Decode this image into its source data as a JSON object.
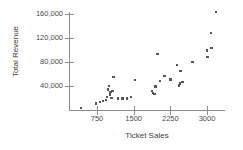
{
  "chart_data": {
    "type": "scatter",
    "title": "",
    "xlabel": "Ticket Sales",
    "ylabel": "Total Revenue",
    "xlim": [
      0,
      3300
    ],
    "ylim": [
      0,
      172000
    ],
    "grid": false,
    "legend": null,
    "xticks": [
      750,
      1500,
      2250,
      3000
    ],
    "xticklabels": [
      "750",
      "1500",
      "2250",
      "3000"
    ],
    "yticks": [
      40000,
      80000,
      120000,
      160000
    ],
    "yticklabels": [
      "40,000",
      "80,000",
      "120,000",
      "160,000"
    ],
    "marker": "square",
    "marker_color": "#555555",
    "points": [
      {
        "x": 420,
        "y": 3000
      },
      {
        "x": 730,
        "y": 11000
      },
      {
        "x": 810,
        "y": 13000
      },
      {
        "x": 870,
        "y": 15000
      },
      {
        "x": 930,
        "y": 17000
      },
      {
        "x": 960,
        "y": 22000
      },
      {
        "x": 980,
        "y": 34000
      },
      {
        "x": 1000,
        "y": 40000
      },
      {
        "x": 1010,
        "y": 26000
      },
      {
        "x": 1030,
        "y": 30000
      },
      {
        "x": 1050,
        "y": 20000
      },
      {
        "x": 1070,
        "y": 32000
      },
      {
        "x": 1090,
        "y": 55000
      },
      {
        "x": 1180,
        "y": 19000
      },
      {
        "x": 1270,
        "y": 19000
      },
      {
        "x": 1360,
        "y": 19000
      },
      {
        "x": 1450,
        "y": 22000
      },
      {
        "x": 1530,
        "y": 50000
      },
      {
        "x": 1880,
        "y": 32000
      },
      {
        "x": 1900,
        "y": 28000
      },
      {
        "x": 1930,
        "y": 27000
      },
      {
        "x": 1950,
        "y": 39000
      },
      {
        "x": 1990,
        "y": 93000
      },
      {
        "x": 2040,
        "y": 48000
      },
      {
        "x": 2130,
        "y": 57000
      },
      {
        "x": 2250,
        "y": 51000
      },
      {
        "x": 2390,
        "y": 75000
      },
      {
        "x": 2430,
        "y": 41000
      },
      {
        "x": 2450,
        "y": 44000
      },
      {
        "x": 2460,
        "y": 65000
      },
      {
        "x": 2500,
        "y": 47000
      },
      {
        "x": 2700,
        "y": 80000
      },
      {
        "x": 3000,
        "y": 99000
      },
      {
        "x": 3010,
        "y": 88000
      },
      {
        "x": 3080,
        "y": 128000
      },
      {
        "x": 3090,
        "y": 103000
      },
      {
        "x": 3180,
        "y": 163000
      }
    ]
  }
}
